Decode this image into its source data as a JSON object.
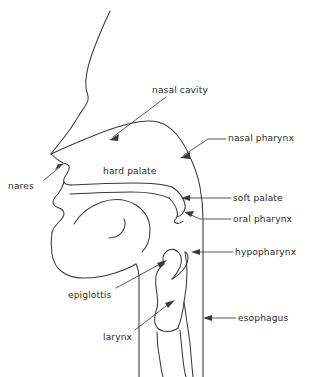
{
  "figure": {
    "kind": "anatomical-line-diagram",
    "view": "lateral / mid-sagittal, facing left",
    "background_color": "#ffffff",
    "line_color": "#3a3a3a",
    "text_color": "#2b2b2b"
  },
  "labels": [
    {
      "id": "nasal-cavity",
      "text": "nasal cavity",
      "text_x": 152,
      "text_y": 86,
      "leader": "from label left-bottom down-left into nasal cavity space",
      "has_arrowhead": true
    },
    {
      "id": "nasal-pharynx",
      "text": "nasal pharynx",
      "text_x": 228,
      "text_y": 134,
      "leader": "from label left horizontally then down-left to posterior nasopharynx",
      "has_arrowhead": true
    },
    {
      "id": "hard-palate",
      "text": "hard palate",
      "text_x": 103,
      "text_y": 167,
      "leader": "none",
      "has_arrowhead": false
    },
    {
      "id": "nares",
      "text": "nares",
      "text_x": 8,
      "text_y": 182,
      "leader": "from label up-right to nostril opening",
      "has_arrowhead": true
    },
    {
      "id": "soft-palate",
      "text": "soft palate",
      "text_x": 233,
      "text_y": 194,
      "leader": "from label horizontally left to soft palate",
      "has_arrowhead": true
    },
    {
      "id": "oral-pharynx",
      "text": "oral pharynx",
      "text_x": 233,
      "text_y": 215,
      "leader": "from label horizontally left to oropharynx below uvula",
      "has_arrowhead": true
    },
    {
      "id": "hypopharynx",
      "text": "hypopharynx",
      "text_x": 235,
      "text_y": 248,
      "leader": "from label horizontally left to hypopharynx",
      "has_arrowhead": true
    },
    {
      "id": "epiglottis",
      "text": "epiglottis",
      "text_x": 68,
      "text_y": 291,
      "leader": "from label up-right to epiglottis",
      "has_arrowhead": true
    },
    {
      "id": "esophagus",
      "text": "esophagus",
      "text_x": 238,
      "text_y": 314,
      "leader": "from label horizontally left to esophagus",
      "has_arrowhead": true
    },
    {
      "id": "larynx",
      "text": "larynx",
      "text_x": 103,
      "text_y": 333,
      "leader": "from label up-right into larynx",
      "has_arrowhead": true
    }
  ],
  "structures": [
    "forehead and nose profile",
    "nasal cavity roof",
    "hard palate",
    "soft palate and uvula",
    "lips",
    "tongue",
    "mandible and chin",
    "epiglottis",
    "larynx",
    "trachea",
    "posterior pharyngeal wall",
    "esophagus"
  ]
}
